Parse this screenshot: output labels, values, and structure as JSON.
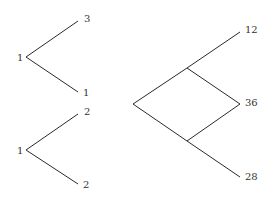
{
  "tree_a": {
    "root_label": "1",
    "top_label": "3",
    "bottom_label": "1"
  },
  "tree_b": {
    "root_label": "1",
    "top_label": "2",
    "bottom_label": "2"
  },
  "lattice": {
    "top_label": "12",
    "middle_label": "36",
    "bottom_label": "28"
  },
  "colors": {
    "line": "#2a2a2a",
    "text": "#333333",
    "background": "#ffffff"
  }
}
